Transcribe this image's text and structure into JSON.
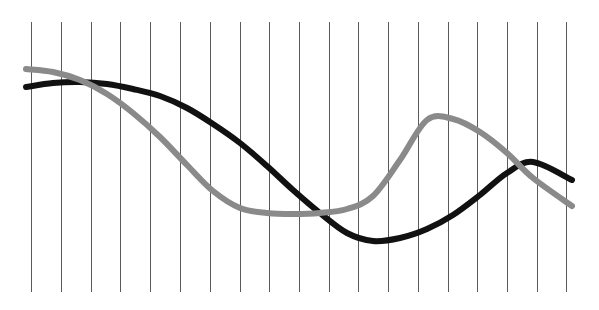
{
  "chart_data": {
    "type": "line",
    "title": "",
    "subtitle": "",
    "xlabel": "",
    "ylabel": "",
    "grid": {
      "vertical": true,
      "horizontal": false,
      "line_count": 19,
      "color": "#5a5a5a",
      "width": 1,
      "x_positions": [
        31,
        61,
        91,
        120,
        150,
        180,
        210,
        240,
        269,
        299,
        329,
        358,
        388,
        418,
        448,
        477,
        507,
        537,
        566
      ],
      "y_top": 22,
      "y_bottom": 292
    },
    "background_color": "#ffffff",
    "plot_area": {
      "x": 26,
      "y": 22,
      "width": 546,
      "height": 270
    },
    "xlim": [
      0,
      18
    ],
    "ylim": [
      0,
      100
    ],
    "x_tick_labels": [],
    "y_tick_labels": [],
    "legend": {
      "show": false,
      "position": "none",
      "entries": []
    },
    "annotations": [],
    "series": [
      {
        "name": "Series 1",
        "color": "#111111",
        "stroke_width": 6,
        "style": "solid",
        "x": [
          0.0,
          0.9,
          1.8,
          2.7,
          3.6,
          4.5,
          5.4,
          6.3,
          7.2,
          8.1,
          9.0,
          9.9,
          10.8,
          11.7,
          12.6,
          13.5,
          14.4,
          15.3,
          16.2,
          17.1,
          18.0
        ],
        "y": [
          76.0,
          77.5,
          78.0,
          77.2,
          75.3,
          72.5,
          68.2,
          62.0,
          54.5,
          46.0,
          37.0,
          28.0,
          20.5,
          17.5,
          18.5,
          22.0,
          27.5,
          35.0,
          43.5,
          50.0,
          48.5
        ],
        "pixel_points": [
          [
            26,
            87
          ],
          [
            53,
            83
          ],
          [
            80,
            82
          ],
          [
            107,
            84
          ],
          [
            133,
            89
          ],
          [
            160,
            96
          ],
          [
            187,
            108
          ],
          [
            213,
            124
          ],
          [
            240,
            143
          ],
          [
            267,
            166
          ],
          [
            293,
            190
          ],
          [
            320,
            213
          ],
          [
            347,
            233
          ],
          [
            373,
            241
          ],
          [
            400,
            238
          ],
          [
            427,
            229
          ],
          [
            453,
            215
          ],
          [
            480,
            195
          ],
          [
            507,
            173
          ],
          [
            533,
            162
          ],
          [
            572,
            180
          ]
        ]
      },
      {
        "name": "Series 2",
        "color": "#8a8a8a",
        "stroke_width": 6,
        "style": "solid",
        "x": [
          0.0,
          0.9,
          1.8,
          2.7,
          3.6,
          4.5,
          5.4,
          6.3,
          7.2,
          8.1,
          9.0,
          9.9,
          10.8,
          11.7,
          12.6,
          13.5,
          14.4,
          15.3,
          16.2,
          17.1,
          18.0
        ],
        "y": [
          83.0,
          82.0,
          79.0,
          73.5,
          66.0,
          57.0,
          46.0,
          36.0,
          29.5,
          27.5,
          27.2,
          27.5,
          29.0,
          34.0,
          48.0,
          63.5,
          64.0,
          59.0,
          51.0,
          41.0,
          30.5
        ],
        "pixel_points": [
          [
            26,
            69
          ],
          [
            53,
            72
          ],
          [
            80,
            80
          ],
          [
            107,
            94
          ],
          [
            133,
            113
          ],
          [
            160,
            137
          ],
          [
            187,
            165
          ],
          [
            213,
            191
          ],
          [
            240,
            208
          ],
          [
            267,
            213
          ],
          [
            293,
            214
          ],
          [
            320,
            213
          ],
          [
            347,
            209
          ],
          [
            373,
            196
          ],
          [
            400,
            160
          ],
          [
            427,
            120
          ],
          [
            453,
            119
          ],
          [
            480,
            132
          ],
          [
            507,
            153
          ],
          [
            533,
            178
          ],
          [
            572,
            206
          ]
        ]
      }
    ]
  }
}
